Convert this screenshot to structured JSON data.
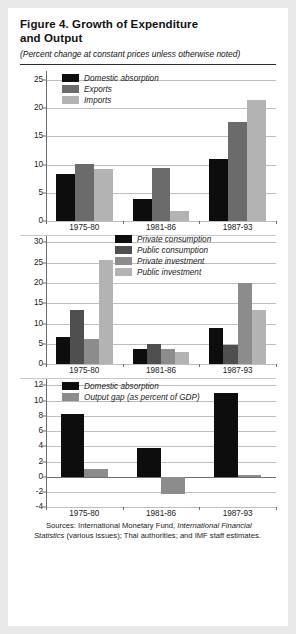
{
  "figure": {
    "title": "Figure 4.  Growth of Expenditure and Output",
    "title_line1": "Figure 4.  Growth of Expenditure",
    "title_line2": "and Output",
    "subtitle": "(Percent change at constant prices unless otherwise noted)",
    "sources_prefix": "Sources:  International Monetary Fund, ",
    "sources_italic": "International Financial Statistics",
    "sources_suffix": " (various issues); Thai authorities; and IMF staff estimates."
  },
  "colors": {
    "black": "#0d0d0d",
    "dark_gray": "#6b6b6b",
    "mid_gray": "#8c8c8c",
    "light_gray": "#b3b3b3",
    "gridline": "#bdbdbd",
    "axis": "#6d6d6d",
    "page_background": "#e9e9e9",
    "panel_background": "#ffffff"
  },
  "chart_data": [
    {
      "type": "bar",
      "id": "panel-1",
      "title": "",
      "xlabel": "",
      "ylabel": "",
      "categories": [
        "1975-80",
        "1981-86",
        "1987-93"
      ],
      "yticks": [
        0,
        5,
        10,
        15,
        20,
        25
      ],
      "ylim": [
        0,
        26.5
      ],
      "grid": true,
      "legend_position": "top-left-inside",
      "series": [
        {
          "name": "Domestic absorption",
          "color": "#0d0d0d",
          "values": [
            8.3,
            3.9,
            11.0
          ]
        },
        {
          "name": "Exports",
          "color": "#6b6b6b",
          "values": [
            10.2,
            9.5,
            17.5
          ]
        },
        {
          "name": "Imports",
          "color": "#b3b3b3",
          "values": [
            9.2,
            1.8,
            21.5
          ]
        }
      ]
    },
    {
      "type": "bar",
      "id": "panel-2",
      "title": "",
      "xlabel": "",
      "ylabel": "",
      "categories": [
        "1975-80",
        "1981-86",
        "1987-93"
      ],
      "yticks": [
        0,
        5,
        10,
        15,
        20,
        25,
        30
      ],
      "ylim": [
        0,
        31.5
      ],
      "grid": true,
      "legend_position": "top-center-inside",
      "series": [
        {
          "name": "Private consumption",
          "color": "#0d0d0d",
          "values": [
            6.8,
            3.8,
            9.0
          ]
        },
        {
          "name": "Public consumption",
          "color": "#4f4f4f",
          "values": [
            13.3,
            5.0,
            4.8
          ]
        },
        {
          "name": "Private investment",
          "color": "#8c8c8c",
          "values": [
            6.2,
            3.7,
            20.0
          ]
        },
        {
          "name": "Public investment",
          "color": "#b3b3b3",
          "values": [
            25.7,
            3.0,
            13.3
          ]
        }
      ]
    },
    {
      "type": "bar",
      "id": "panel-3",
      "title": "",
      "xlabel": "",
      "ylabel": "",
      "categories": [
        "1975-80",
        "1981-86",
        "1987-93"
      ],
      "yticks": [
        -4,
        -2,
        0,
        2,
        4,
        6,
        8,
        10,
        12
      ],
      "ylim": [
        -4,
        12.8
      ],
      "grid": true,
      "legend_position": "top-left-inside",
      "series": [
        {
          "name": "Domestic absorption",
          "color": "#0d0d0d",
          "values": [
            8.3,
            3.8,
            11.0
          ]
        },
        {
          "name": "Output gap (as percent of GDP)",
          "color": "#8c8c8c",
          "values": [
            1.0,
            -2.3,
            0.2
          ]
        }
      ]
    }
  ]
}
